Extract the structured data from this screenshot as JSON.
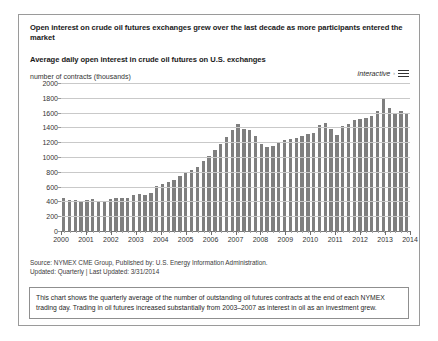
{
  "headline": "Open interest on crude oil futures exchanges grew over the last decade as more participants entered the market",
  "subhead": "Average daily open interest in crude oil futures on U.S. exchanges",
  "interactive": {
    "label": "interactive",
    "caret": "›",
    "menu_icon": "hamburger-menu-icon"
  },
  "source": {
    "line1": "Source: NYMEX CME Group, Published by: U.S. Energy Information Administration.",
    "line2": "Updated: Quarterly | Last Updated: 3/31/2014"
  },
  "note": "This chart shows the quarterly average of the number of outstanding oil futures contracts at the end of each NYMEX trading day. Trading in oil futures increased substantially from 2003–2007 as interest in oil as an investment grew.",
  "colors": {
    "bar": "#7f7f7f",
    "gridline": "#c9c9c9",
    "axis": "#7a7a7a",
    "border": "#9a9a9a",
    "text": "#1a1a1a"
  },
  "chart_data": {
    "type": "bar",
    "title": "Average daily open interest in crude oil futures on U.S. exchanges",
    "subtitle": "Open interest on crude oil futures exchanges grew over the last decade as more participants entered the market",
    "xlabel": "",
    "ylabel": "number of contracts (thousands)",
    "ylim": [
      0,
      2000
    ],
    "yticks": [
      0,
      200,
      400,
      600,
      800,
      1000,
      1200,
      1400,
      1600,
      1800,
      2000
    ],
    "xticks": [
      "2000",
      "2001",
      "2002",
      "2003",
      "2004",
      "2005",
      "2006",
      "2007",
      "2008",
      "2009",
      "2010",
      "2011",
      "2012",
      "2013",
      "2014"
    ],
    "grid": true,
    "legend": false,
    "frequency": "quarterly",
    "categories": [
      "2000 Q1",
      "2000 Q2",
      "2000 Q3",
      "2000 Q4",
      "2001 Q1",
      "2001 Q2",
      "2001 Q3",
      "2001 Q4",
      "2002 Q1",
      "2002 Q2",
      "2002 Q3",
      "2002 Q4",
      "2003 Q1",
      "2003 Q2",
      "2003 Q3",
      "2003 Q4",
      "2004 Q1",
      "2004 Q2",
      "2004 Q3",
      "2004 Q4",
      "2005 Q1",
      "2005 Q2",
      "2005 Q3",
      "2005 Q4",
      "2006 Q1",
      "2006 Q2",
      "2006 Q3",
      "2006 Q4",
      "2007 Q1",
      "2007 Q2",
      "2007 Q3",
      "2007 Q4",
      "2008 Q1",
      "2008 Q2",
      "2008 Q3",
      "2008 Q4",
      "2009 Q1",
      "2009 Q2",
      "2009 Q3",
      "2009 Q4",
      "2010 Q1",
      "2010 Q2",
      "2010 Q3",
      "2010 Q4",
      "2011 Q1",
      "2011 Q2",
      "2011 Q3",
      "2011 Q4",
      "2012 Q1",
      "2012 Q2",
      "2012 Q3",
      "2012 Q4",
      "2013 Q1",
      "2013 Q2",
      "2013 Q3",
      "2013 Q4",
      "2014 Q1",
      "2014 Q2",
      "2014 Q3",
      "2014 Q4"
    ],
    "values": [
      440,
      420,
      420,
      410,
      420,
      430,
      400,
      390,
      430,
      450,
      440,
      450,
      480,
      500,
      490,
      510,
      610,
      640,
      660,
      690,
      740,
      790,
      820,
      860,
      940,
      1010,
      1090,
      1180,
      1270,
      1360,
      1450,
      1380,
      1370,
      1290,
      1180,
      1130,
      1150,
      1200,
      1230,
      1240,
      1260,
      1290,
      1310,
      1330,
      1430,
      1460,
      1380,
      1300,
      1420,
      1450,
      1500,
      1510,
      1530,
      1560,
      1620,
      1800,
      1660,
      1600,
      1620,
      1590
    ]
  }
}
